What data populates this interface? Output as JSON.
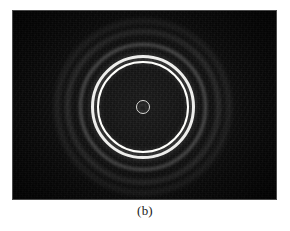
{
  "figure": {
    "caption": "(b)",
    "panel_label": "b",
    "background_color": "#ffffff",
    "plate_color": "#070707",
    "plate": {
      "x": 13,
      "y": 11,
      "width": 263,
      "height": 188
    }
  },
  "chart_data": {
    "type": "scatter",
    "title": "",
    "subtitle": "",
    "xlabel": "",
    "ylabel": "",
    "annotations": [
      "(b)"
    ],
    "legend": [],
    "grid": false,
    "center": {
      "x": 143,
      "y": 107
    },
    "rings": [
      {
        "name": "central-spot-ring",
        "radius": 7,
        "brightness": 0.82,
        "thickness": 1.6,
        "type": "bright"
      },
      {
        "name": "inner-bright-ring",
        "radius": 46,
        "brightness": 1.0,
        "thickness": 2.6,
        "type": "bright"
      },
      {
        "name": "outer-bright-ring",
        "radius": 52,
        "brightness": 0.95,
        "thickness": 3.2,
        "type": "bright"
      },
      {
        "name": "faint-ring-1",
        "radius": 64,
        "brightness": 0.22,
        "thickness": 3.0,
        "type": "faint"
      },
      {
        "name": "faint-ring-2",
        "radius": 77,
        "brightness": 0.17,
        "thickness": 3.5,
        "type": "faint"
      },
      {
        "name": "faint-ring-3",
        "radius": 88,
        "brightness": 0.1,
        "thickness": 4.0,
        "type": "faint"
      }
    ],
    "ring_count": 6,
    "bright_ring_count": 3,
    "faint_ring_count": 3
  }
}
